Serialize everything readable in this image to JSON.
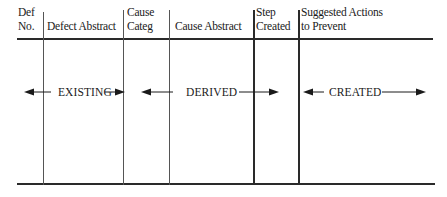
{
  "table": {
    "headers": [
      {
        "line1": "Def",
        "line2": "No."
      },
      {
        "line1": "",
        "line2": "Defect Abstract"
      },
      {
        "line1": "Cause",
        "line2": "Categ"
      },
      {
        "line1": "",
        "line2": "Cause Abstract"
      },
      {
        "line1": "Step",
        "line2": "Created"
      },
      {
        "line1": "Suggested Actions",
        "line2": "to Prevent"
      }
    ],
    "spans": [
      {
        "label": "EXISTING",
        "covers": [
          "Def No.",
          "Defect Abstract"
        ]
      },
      {
        "label": "DERIVED",
        "covers": [
          "Cause Categ",
          "Cause Abstract",
          "Step Created"
        ]
      },
      {
        "label": "CREATED",
        "covers": [
          "Suggested Actions to Prevent"
        ]
      }
    ]
  },
  "icons": {
    "arrow_left": "left-arrow-icon",
    "arrow_right": "right-arrow-icon"
  }
}
